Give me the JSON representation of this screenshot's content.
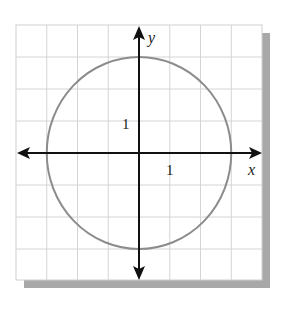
{
  "graph": {
    "axes": {
      "x_label": "x",
      "y_label": "y",
      "x_tick_label": "1",
      "y_tick_label": "1"
    },
    "grid": {
      "x_range": [
        -4,
        4
      ],
      "y_range": [
        -4,
        4
      ],
      "step": 1
    },
    "curve": {
      "type": "circle",
      "center": [
        0,
        0
      ],
      "radius": 3,
      "equation": "x^2 + y^2 = 9",
      "color": "#8c8c8c"
    },
    "colors": {
      "grid": "#d4d4d4",
      "axis": "#111111",
      "shadow": "#a8a8a8"
    }
  }
}
